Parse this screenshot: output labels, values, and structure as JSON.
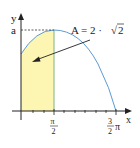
{
  "diagram": {
    "axes": {
      "y_label": "y",
      "x_label": "x",
      "a_label": "a"
    },
    "ticks": {
      "pi_half_num": "π",
      "pi_half_den": "2",
      "three_half_num": "3",
      "three_half_den": "2",
      "three_half_pi": "π"
    },
    "annotation": {
      "text": "A = 2 · √2",
      "lhs": "A = 2 ·",
      "radical": "√",
      "radicand": "2"
    },
    "colors": {
      "curve": "#5b9bd5",
      "fill": "#fdf6b2",
      "axis": "#222222",
      "divider": "#7fb27f",
      "dashed": "#333333"
    }
  }
}
